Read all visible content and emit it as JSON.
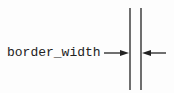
{
  "diagram": {
    "label": "border_width",
    "colors": {
      "line": "#222222",
      "background": "#fdfdfd"
    },
    "lines": [
      {
        "name": "inner-border-line",
        "x": 130,
        "y1": 8,
        "y2": 90
      },
      {
        "name": "outer-border-line",
        "x": 141,
        "y1": 8,
        "y2": 90
      }
    ],
    "arrows": [
      {
        "name": "left-arrow",
        "from_x": 104,
        "to_x": 129,
        "y": 53
      },
      {
        "name": "right-arrow",
        "from_x": 166,
        "to_x": 142,
        "y": 53
      }
    ]
  }
}
